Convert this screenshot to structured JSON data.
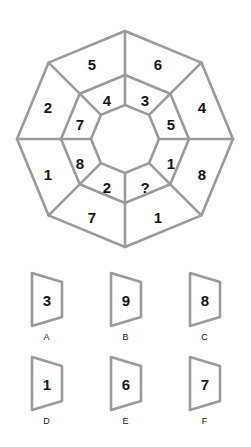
{
  "puzzle": {
    "type": "octagon-ring-number-puzzle",
    "line_color": "#9a9a9a",
    "text_color": "#141414",
    "background": "#ffffff",
    "missing_marker": "?",
    "outer_ring": {
      "label": "outer-ring",
      "cells": [
        {
          "pos": "top-left",
          "value": "5"
        },
        {
          "pos": "top-right",
          "value": "6"
        },
        {
          "pos": "right-upper",
          "value": "4"
        },
        {
          "pos": "right-lower",
          "value": "8"
        },
        {
          "pos": "bottom-right",
          "value": "1"
        },
        {
          "pos": "bottom-left",
          "value": "7"
        },
        {
          "pos": "left-lower",
          "value": "1"
        },
        {
          "pos": "left-upper",
          "value": "2"
        }
      ]
    },
    "inner_ring": {
      "label": "inner-ring",
      "cells": [
        {
          "pos": "top-left",
          "value": "4"
        },
        {
          "pos": "top-right",
          "value": "3"
        },
        {
          "pos": "right-upper",
          "value": "5"
        },
        {
          "pos": "right-lower",
          "value": "1"
        },
        {
          "pos": "bottom-right",
          "value": "?"
        },
        {
          "pos": "bottom-left",
          "value": "2"
        },
        {
          "pos": "left-lower",
          "value": "8"
        },
        {
          "pos": "left-upper",
          "value": "7"
        }
      ]
    },
    "core": {
      "label": "empty-center",
      "value": ""
    }
  },
  "options": {
    "label": "answer-options",
    "items": [
      {
        "letter": "A",
        "value": "3"
      },
      {
        "letter": "B",
        "value": "9"
      },
      {
        "letter": "C",
        "value": "8"
      },
      {
        "letter": "D",
        "value": "1"
      },
      {
        "letter": "E",
        "value": "6"
      },
      {
        "letter": "F",
        "value": "7"
      }
    ]
  }
}
